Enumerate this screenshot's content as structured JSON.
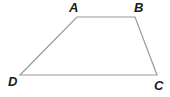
{
  "diagram": {
    "type": "trapezoid",
    "stroke_color": "#9a9a9a",
    "label_color": "#1a1a1a",
    "vertices": [
      {
        "name": "A",
        "x": 77,
        "y": 17,
        "label_x": 69,
        "label_y": 12
      },
      {
        "name": "B",
        "x": 135,
        "y": 17,
        "label_x": 134,
        "label_y": 12
      },
      {
        "name": "C",
        "x": 157,
        "y": 75,
        "label_x": 154,
        "label_y": 90
      },
      {
        "name": "D",
        "x": 20,
        "y": 75,
        "label_x": 8,
        "label_y": 86
      }
    ],
    "sides": [
      "AB",
      "BC",
      "CD",
      "DA"
    ]
  }
}
